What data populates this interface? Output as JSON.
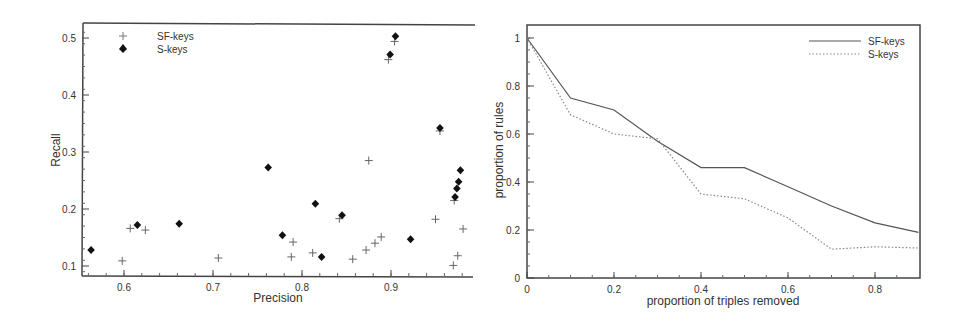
{
  "chart_data": [
    {
      "type": "scatter",
      "title": "",
      "xlabel": "Precision",
      "ylabel": "Recall",
      "xlim": [
        0.553,
        0.992
      ],
      "ylim": [
        0.082,
        0.525
      ],
      "xticks": [
        "0.6",
        "0.7",
        "0.8",
        "0.9"
      ],
      "yticks": [
        "0.1",
        "0.2",
        "0.3",
        "0.4",
        "0.5"
      ],
      "grid": false,
      "legend_position": "upper left",
      "series": [
        {
          "name": "SF-keys",
          "marker": "plus",
          "color": "#666666",
          "points": [
            [
              0.598,
              0.109
            ],
            [
              0.607,
              0.166
            ],
            [
              0.624,
              0.163
            ],
            [
              0.706,
              0.114
            ],
            [
              0.788,
              0.116
            ],
            [
              0.79,
              0.142
            ],
            [
              0.812,
              0.123
            ],
            [
              0.842,
              0.183
            ],
            [
              0.857,
              0.112
            ],
            [
              0.872,
              0.128
            ],
            [
              0.875,
              0.285
            ],
            [
              0.882,
              0.14
            ],
            [
              0.889,
              0.151
            ],
            [
              0.897,
              0.462
            ],
            [
              0.904,
              0.494
            ],
            [
              0.95,
              0.182
            ],
            [
              0.955,
              0.337
            ],
            [
              0.97,
              0.101
            ],
            [
              0.971,
              0.215
            ],
            [
              0.975,
              0.118
            ],
            [
              0.981,
              0.165
            ]
          ]
        },
        {
          "name": "S-keys",
          "marker": "diamond",
          "color": "#111111",
          "points": [
            [
              0.563,
              0.128
            ],
            [
              0.615,
              0.172
            ],
            [
              0.662,
              0.174
            ],
            [
              0.762,
              0.273
            ],
            [
              0.778,
              0.154
            ],
            [
              0.815,
              0.209
            ],
            [
              0.822,
              0.116
            ],
            [
              0.845,
              0.189
            ],
            [
              0.922,
              0.147
            ],
            [
              0.899,
              0.471
            ],
            [
              0.905,
              0.503
            ],
            [
              0.955,
              0.342
            ],
            [
              0.972,
              0.221
            ],
            [
              0.974,
              0.236
            ],
            [
              0.976,
              0.248
            ],
            [
              0.978,
              0.268
            ]
          ]
        }
      ]
    },
    {
      "type": "line",
      "title": "",
      "xlabel": "proportion of triples removed",
      "ylabel": "proportion of rules",
      "xlim": [
        0,
        0.9
      ],
      "ylim": [
        0,
        1.05
      ],
      "xticks": [
        "0",
        "0.2",
        "0.4",
        "0.6",
        "0.8"
      ],
      "yticks": [
        "0",
        "0.2",
        "0.4",
        "0.6",
        "0.8",
        "1"
      ],
      "grid": false,
      "legend_position": "upper right",
      "x": [
        0,
        0.1,
        0.2,
        0.3,
        0.4,
        0.5,
        0.6,
        0.7,
        0.8,
        0.9
      ],
      "series": [
        {
          "name": "SF-keys",
          "style": "solid",
          "color": "#555555",
          "values": [
            1.0,
            0.75,
            0.7,
            0.57,
            0.46,
            0.46,
            0.38,
            0.3,
            0.23,
            0.19
          ]
        },
        {
          "name": "S-keys",
          "style": "dotted",
          "color": "#888888",
          "values": [
            1.0,
            0.68,
            0.6,
            0.58,
            0.35,
            0.33,
            0.25,
            0.12,
            0.13,
            0.125
          ]
        }
      ]
    }
  ],
  "left_chart": {
    "xlabel": "Precision",
    "ylabel": "Recall",
    "legend": [
      "SF-keys",
      "S-keys"
    ]
  },
  "right_chart": {
    "xlabel": "proportion of triples removed",
    "ylabel": "proportion of rules",
    "legend": [
      "SF-keys",
      "S-keys"
    ]
  }
}
